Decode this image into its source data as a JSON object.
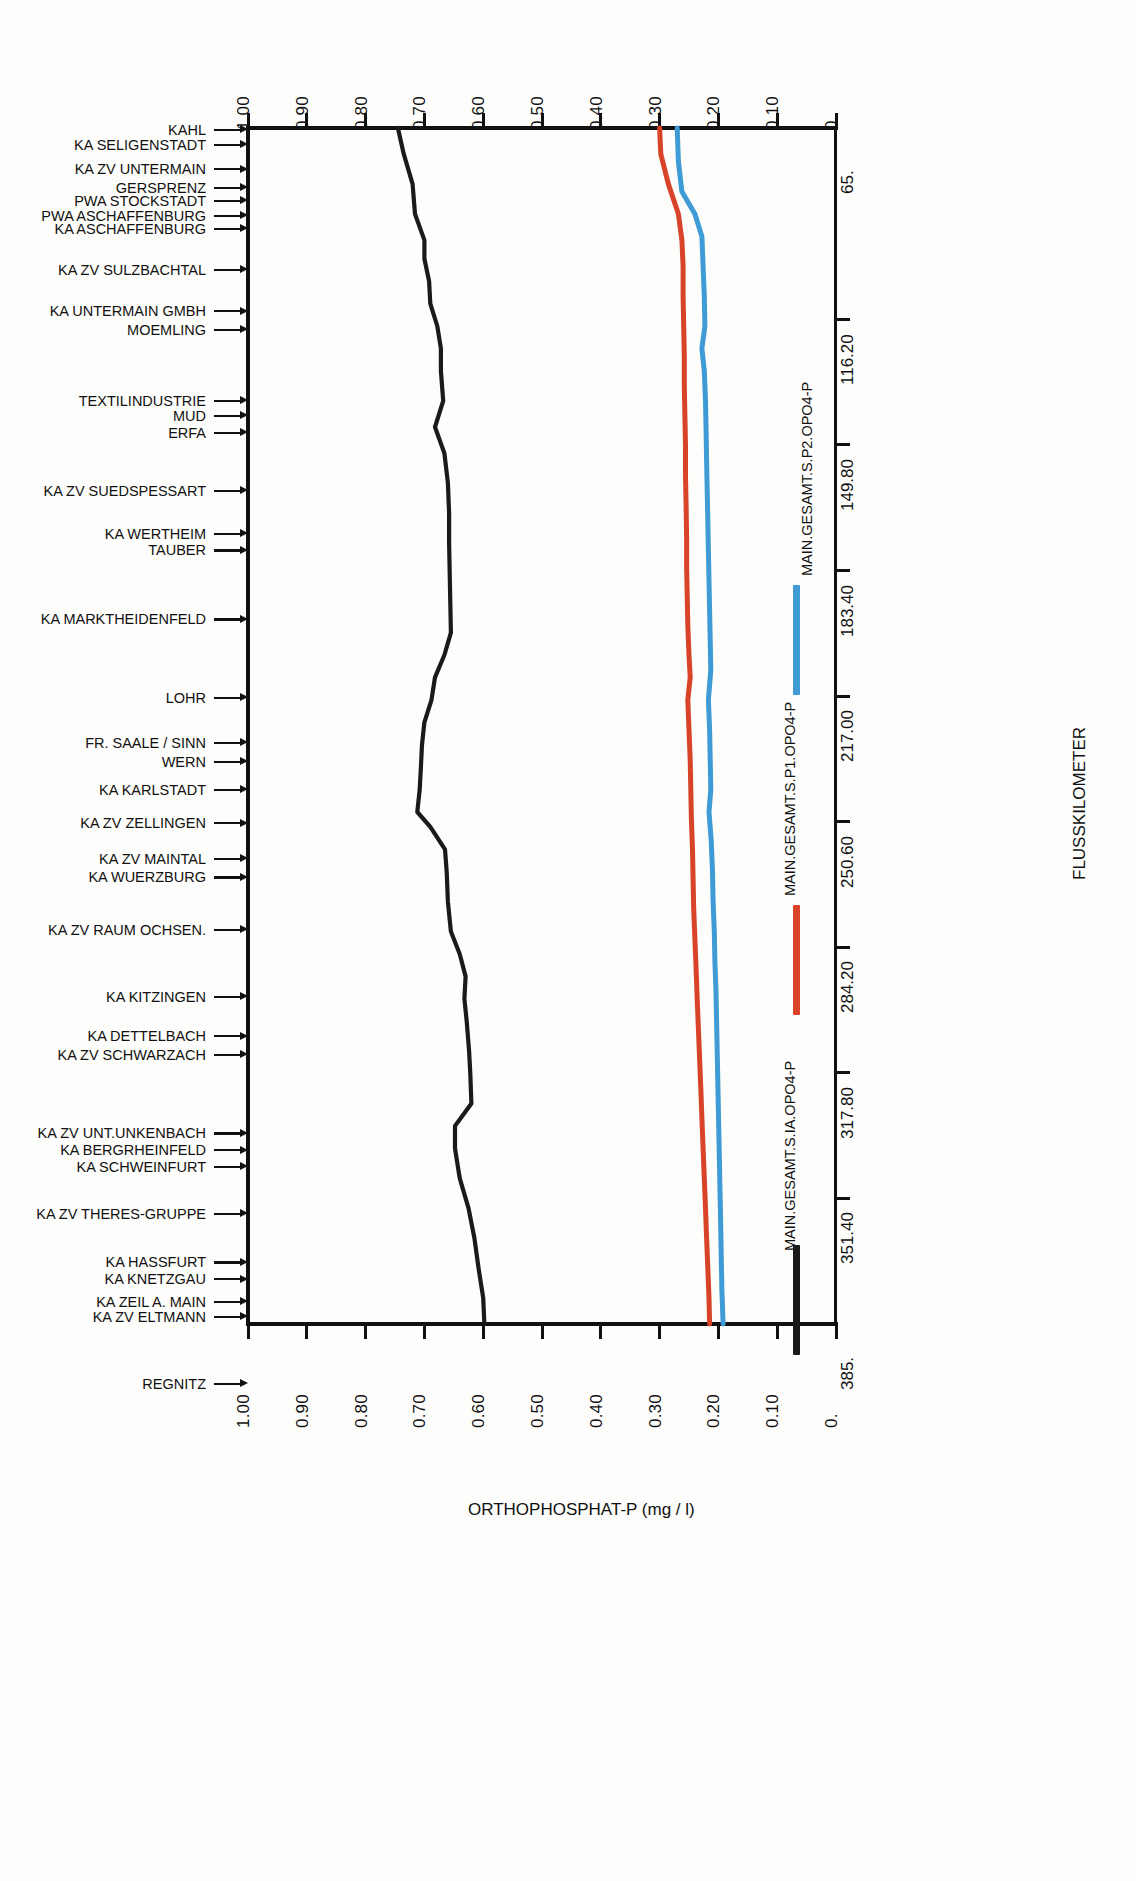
{
  "chart_data": {
    "type": "line",
    "title": "",
    "xlabel": "ORTHOPHOSPHAT-P (mg / l)",
    "ylabel": "FLUSSKILOMETER",
    "orientation": "horizontal-profile",
    "xlim": [
      0.0,
      1.0
    ],
    "ylim": [
      65.0,
      385.0
    ],
    "xticks": [
      "1.00",
      "0.90",
      "0.80",
      "0.70",
      "0.60",
      "0.50",
      "0.40",
      "0.30",
      "0.20",
      "0.10",
      "0."
    ],
    "xtick_values": [
      1.0,
      0.9,
      0.8,
      0.7,
      0.6,
      0.5,
      0.4,
      0.3,
      0.2,
      0.1,
      0.0
    ],
    "yticks": [
      "65.",
      "116.20",
      "149.80",
      "183.40",
      "217.00",
      "250.60",
      "284.20",
      "317.80",
      "351.40",
      "385."
    ],
    "ytick_values": [
      65.0,
      116.2,
      149.8,
      183.4,
      217.0,
      250.6,
      284.2,
      317.8,
      351.4,
      385.0
    ],
    "grid": false,
    "legend_position": "right",
    "series": [
      {
        "name": "MAIN.GESAMT.S.IA.OPO4-P",
        "color": "#1a1a1a",
        "points": [
          [
            65.0,
            0.745
          ],
          [
            72.0,
            0.735
          ],
          [
            80.0,
            0.72
          ],
          [
            88.0,
            0.716
          ],
          [
            95.0,
            0.7
          ],
          [
            100.0,
            0.7
          ],
          [
            106.0,
            0.692
          ],
          [
            112.0,
            0.69
          ],
          [
            118.0,
            0.678
          ],
          [
            124.0,
            0.672
          ],
          [
            130.0,
            0.672
          ],
          [
            138.0,
            0.668
          ],
          [
            145.0,
            0.682
          ],
          [
            152.0,
            0.666
          ],
          [
            160.0,
            0.66
          ],
          [
            168.0,
            0.658
          ],
          [
            176.0,
            0.658
          ],
          [
            184.0,
            0.657
          ],
          [
            192.0,
            0.656
          ],
          [
            200.0,
            0.655
          ],
          [
            206.0,
            0.666
          ],
          [
            212.0,
            0.682
          ],
          [
            218.0,
            0.688
          ],
          [
            224.0,
            0.7
          ],
          [
            230.0,
            0.704
          ],
          [
            236.0,
            0.706
          ],
          [
            242.0,
            0.708
          ],
          [
            248.0,
            0.712
          ],
          [
            252.0,
            0.69
          ],
          [
            258.0,
            0.665
          ],
          [
            264.0,
            0.662
          ],
          [
            272.0,
            0.66
          ],
          [
            280.0,
            0.655
          ],
          [
            286.0,
            0.64
          ],
          [
            292.0,
            0.63
          ],
          [
            298.0,
            0.632
          ],
          [
            304.0,
            0.628
          ],
          [
            312.0,
            0.624
          ],
          [
            318.0,
            0.622
          ],
          [
            326.0,
            0.62
          ],
          [
            332.0,
            0.648
          ],
          [
            338.0,
            0.648
          ],
          [
            346.0,
            0.64
          ],
          [
            354.0,
            0.625
          ],
          [
            362.0,
            0.615
          ],
          [
            370.0,
            0.608
          ],
          [
            378.0,
            0.6
          ],
          [
            385.0,
            0.598
          ]
        ]
      },
      {
        "name": "MAIN.GESAMT.S.P1.OPO4-P",
        "color": "#d8432a",
        "points": [
          [
            65.0,
            0.3
          ],
          [
            72.0,
            0.298
          ],
          [
            80.0,
            0.285
          ],
          [
            88.0,
            0.268
          ],
          [
            95.0,
            0.262
          ],
          [
            102.0,
            0.26
          ],
          [
            110.0,
            0.26
          ],
          [
            118.0,
            0.259
          ],
          [
            126.0,
            0.258
          ],
          [
            134.0,
            0.258
          ],
          [
            142.0,
            0.257
          ],
          [
            150.0,
            0.256
          ],
          [
            158.0,
            0.256
          ],
          [
            166.0,
            0.255
          ],
          [
            174.0,
            0.254
          ],
          [
            182.0,
            0.254
          ],
          [
            190.0,
            0.253
          ],
          [
            198.0,
            0.252
          ],
          [
            206.0,
            0.25
          ],
          [
            212.0,
            0.248
          ],
          [
            218.0,
            0.252
          ],
          [
            226.0,
            0.25
          ],
          [
            234.0,
            0.248
          ],
          [
            242.0,
            0.247
          ],
          [
            250.0,
            0.246
          ],
          [
            258.0,
            0.244
          ],
          [
            266.0,
            0.243
          ],
          [
            274.0,
            0.242
          ],
          [
            282.0,
            0.24
          ],
          [
            290.0,
            0.238
          ],
          [
            298.0,
            0.236
          ],
          [
            306.0,
            0.234
          ],
          [
            314.0,
            0.232
          ],
          [
            322.0,
            0.23
          ],
          [
            330.0,
            0.228
          ],
          [
            338.0,
            0.226
          ],
          [
            346.0,
            0.224
          ],
          [
            354.0,
            0.222
          ],
          [
            362.0,
            0.22
          ],
          [
            370.0,
            0.218
          ],
          [
            378.0,
            0.216
          ],
          [
            385.0,
            0.215
          ]
        ]
      },
      {
        "name": "MAIN.GESAMT.S.P2.OPO4-P",
        "color": "#3e9bd6",
        "points": [
          [
            65.0,
            0.27
          ],
          [
            74.0,
            0.268
          ],
          [
            82.0,
            0.262
          ],
          [
            88.0,
            0.24
          ],
          [
            94.0,
            0.228
          ],
          [
            102.0,
            0.226
          ],
          [
            110.0,
            0.224
          ],
          [
            118.0,
            0.223
          ],
          [
            124.0,
            0.228
          ],
          [
            130.0,
            0.224
          ],
          [
            138.0,
            0.222
          ],
          [
            146.0,
            0.221
          ],
          [
            154.0,
            0.22
          ],
          [
            162.0,
            0.219
          ],
          [
            170.0,
            0.218
          ],
          [
            178.0,
            0.217
          ],
          [
            186.0,
            0.216
          ],
          [
            194.0,
            0.215
          ],
          [
            202.0,
            0.214
          ],
          [
            210.0,
            0.213
          ],
          [
            218.0,
            0.217
          ],
          [
            226.0,
            0.215
          ],
          [
            234.0,
            0.214
          ],
          [
            242.0,
            0.213
          ],
          [
            248.0,
            0.216
          ],
          [
            256.0,
            0.212
          ],
          [
            264.0,
            0.21
          ],
          [
            272.0,
            0.209
          ],
          [
            280.0,
            0.207
          ],
          [
            288.0,
            0.206
          ],
          [
            296.0,
            0.204
          ],
          [
            304.0,
            0.203
          ],
          [
            312.0,
            0.202
          ],
          [
            320.0,
            0.201
          ],
          [
            328.0,
            0.2
          ],
          [
            336.0,
            0.199
          ],
          [
            344.0,
            0.198
          ],
          [
            352.0,
            0.197
          ],
          [
            360.0,
            0.196
          ],
          [
            368.0,
            0.195
          ],
          [
            376.0,
            0.194
          ],
          [
            385.0,
            0.192
          ]
        ]
      }
    ],
    "stations": [
      {
        "label": "KAHL",
        "km": 65.5
      },
      {
        "label": "KA SELIGENSTADT",
        "km": 69.5
      },
      {
        "label": "KA ZV UNTERMAIN",
        "km": 76.0
      },
      {
        "label": "GERSPRENZ",
        "km": 81.0
      },
      {
        "label": "PWA STOCKSTADT",
        "km": 84.5
      },
      {
        "label": "PWA ASCHAFFENBURG",
        "km": 88.5
      },
      {
        "label": "KA ASCHAFFENBURG",
        "km": 92.0
      },
      {
        "label": "KA ZV SULZBACHTAL",
        "km": 103.0
      },
      {
        "label": "KA UNTERMAIN GMBH",
        "km": 114.0
      },
      {
        "label": "MOEMLING",
        "km": 119.0
      },
      {
        "label": "TEXTILINDUSTRIE",
        "km": 138.0
      },
      {
        "label": "MUD",
        "km": 142.0
      },
      {
        "label": "ERFA",
        "km": 146.5
      },
      {
        "label": "KA ZV SUEDSPESSART",
        "km": 162.0
      },
      {
        "label": "KA WERTHEIM",
        "km": 173.5
      },
      {
        "label": "TAUBER",
        "km": 178.0
      },
      {
        "label": "KA MARKTHEIDENFELD",
        "km": 196.5
      },
      {
        "label": "LOHR",
        "km": 217.5
      },
      {
        "label": "FR. SAALE / SINN",
        "km": 229.5
      },
      {
        "label": "WERN",
        "km": 234.5
      },
      {
        "label": "KA KARLSTADT",
        "km": 242.0
      },
      {
        "label": "KA ZV ZELLINGEN",
        "km": 251.0
      },
      {
        "label": "KA ZV MAINTAL",
        "km": 260.5
      },
      {
        "label": "KA WUERZBURG",
        "km": 265.5
      },
      {
        "label": "KA ZV RAUM OCHSEN.",
        "km": 279.5
      },
      {
        "label": "KA KITZINGEN",
        "km": 297.5
      },
      {
        "label": "KA DETTELBACH",
        "km": 308.0
      },
      {
        "label": "KA ZV SCHWARZACH",
        "km": 313.0
      },
      {
        "label": "KA ZV UNT.UNKENBACH",
        "km": 334.0
      },
      {
        "label": "KA BERGRHEINFELD",
        "km": 338.5
      },
      {
        "label": "KA SCHWEINFURT",
        "km": 343.0
      },
      {
        "label": "KA ZV THERES-GRUPPE",
        "km": 355.5
      },
      {
        "label": "KA HASSFURT",
        "km": 368.5
      },
      {
        "label": "KA KNETZGAU",
        "km": 373.0
      },
      {
        "label": "KA ZEIL A. MAIN",
        "km": 379.0
      },
      {
        "label": "KA ZV ELTMANN",
        "km": 383.0
      },
      {
        "label": "REGNITZ",
        "km": 401.0
      }
    ]
  },
  "labels": {
    "x_axis_title": "ORTHOPHOSPHAT-P (mg / l)",
    "y_axis_title": "FLUSSKILOMETER"
  }
}
